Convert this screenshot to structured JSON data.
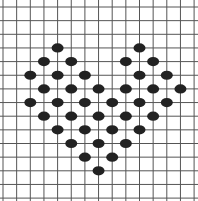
{
  "diagram": {
    "type": "dot-grid",
    "grid": {
      "origin_x": 3,
      "origin_y": 7,
      "spacing": 13.65,
      "columns": 15,
      "rows": 15,
      "line_color": "#555555"
    },
    "dot": {
      "color": "#222222",
      "rx": 6,
      "ry": 4.6
    },
    "dots": [
      [
        4,
        3
      ],
      [
        10,
        3
      ],
      [
        3,
        4
      ],
      [
        5,
        4
      ],
      [
        9,
        4
      ],
      [
        11,
        4
      ],
      [
        2,
        5
      ],
      [
        4,
        5
      ],
      [
        6,
        5
      ],
      [
        10,
        5
      ],
      [
        12,
        5
      ],
      [
        3,
        6
      ],
      [
        5,
        6
      ],
      [
        7,
        6
      ],
      [
        9,
        6
      ],
      [
        11,
        6
      ],
      [
        13,
        6
      ],
      [
        2,
        7
      ],
      [
        4,
        7
      ],
      [
        6,
        7
      ],
      [
        8,
        7
      ],
      [
        10,
        7
      ],
      [
        12,
        7
      ],
      [
        3,
        8
      ],
      [
        5,
        8
      ],
      [
        7,
        8
      ],
      [
        9,
        8
      ],
      [
        11,
        8
      ],
      [
        4,
        9
      ],
      [
        6,
        9
      ],
      [
        8,
        9
      ],
      [
        10,
        9
      ],
      [
        5,
        10
      ],
      [
        7,
        10
      ],
      [
        9,
        10
      ],
      [
        6,
        11
      ],
      [
        8,
        11
      ],
      [
        7,
        12
      ]
    ],
    "dot_count": 38
  }
}
